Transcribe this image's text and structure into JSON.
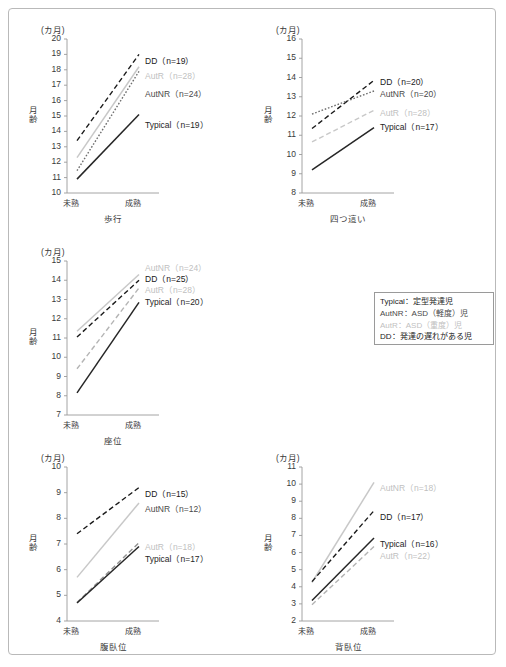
{
  "figure": {
    "unit_label": "(カ月)",
    "y_axis_title": "月齢",
    "x_ticks": [
      "未熟",
      "成熟"
    ],
    "caption": ""
  },
  "legend": {
    "items": [
      {
        "key": "Typical",
        "text": "Typical：定型発達児",
        "color": "#262626"
      },
      {
        "key": "AutNR",
        "text": "AutNR：ASD（軽度）児",
        "color": "#4a4a4a"
      },
      {
        "key": "AutR",
        "text": "AutR：ASD（重度）児",
        "color": "#bfbfbf"
      },
      {
        "key": "DD",
        "text": "DD：発達の遅れがある児",
        "color": "#1a1a1a"
      }
    ]
  },
  "colors": {
    "typical": "#262626",
    "autnr": "#6e6e6e",
    "autr": "#c8c8c8",
    "dd": "#1a1a1a",
    "axis": "#9a9a9a",
    "frame": "#b9b9b9"
  },
  "chart_data": [
    {
      "id": "walking",
      "type": "line",
      "title": "歩行",
      "xlabel": "歩行",
      "ylabel": "月齢",
      "unit": "(カ月)",
      "categories": [
        "未熟",
        "成熟"
      ],
      "x": [
        "未熟",
        "成熟"
      ],
      "ylim": [
        10,
        20
      ],
      "yticks": [
        10,
        11,
        12,
        13,
        14,
        15,
        16,
        17,
        18,
        19,
        20
      ],
      "grid": false,
      "series": [
        {
          "name": "DD",
          "n": 19,
          "label": "DD（n=19）",
          "values": [
            13.4,
            19.0
          ],
          "style": "dashed",
          "color": "#1a1a1a"
        },
        {
          "name": "AutR",
          "n": 28,
          "label": "AutR（n=28）",
          "values": [
            12.3,
            18.2
          ],
          "style": "solid",
          "color": "#c8c8c8"
        },
        {
          "name": "AutNR",
          "n": 24,
          "label": "AutNR（n=24）",
          "values": [
            11.45,
            17.9
          ],
          "style": "dotted",
          "color": "#6e6e6e"
        },
        {
          "name": "Typical",
          "n": 19,
          "label": "Typical（n=19）",
          "values": [
            10.9,
            15.1
          ],
          "style": "solid",
          "color": "#262626"
        }
      ]
    },
    {
      "id": "crawling",
      "type": "line",
      "title": "四つ這い",
      "xlabel": "四つ這い",
      "ylabel": "月齢",
      "unit": "(カ月)",
      "categories": [
        "未熟",
        "成熟"
      ],
      "x": [
        "未熟",
        "成熟"
      ],
      "ylim": [
        8,
        16
      ],
      "yticks": [
        8,
        9,
        10,
        11,
        12,
        13,
        14,
        15,
        16
      ],
      "grid": false,
      "series": [
        {
          "name": "DD",
          "n": 20,
          "label": "DD（n=20）",
          "values": [
            11.35,
            13.85
          ],
          "style": "dashed",
          "color": "#1a1a1a"
        },
        {
          "name": "AutNR",
          "n": 20,
          "label": "AutNR（n=20）",
          "values": [
            12.1,
            13.3
          ],
          "style": "dotted",
          "color": "#6e6e6e"
        },
        {
          "name": "AutR",
          "n": 28,
          "label": "AutR（n=28）",
          "values": [
            10.65,
            12.3
          ],
          "style": "dashed",
          "color": "#c8c8c8"
        },
        {
          "name": "Typical",
          "n": 17,
          "label": "Typical（n=17）",
          "values": [
            9.2,
            11.4
          ],
          "style": "solid",
          "color": "#262626"
        }
      ]
    },
    {
      "id": "sitting",
      "type": "line",
      "title": "座位",
      "xlabel": "座位",
      "ylabel": "月齢",
      "unit": "(カ月)",
      "categories": [
        "未熟",
        "成熟"
      ],
      "x": [
        "未熟",
        "成熟"
      ],
      "ylim": [
        7,
        15
      ],
      "yticks": [
        7,
        8,
        9,
        10,
        11,
        12,
        13,
        14,
        15
      ],
      "grid": false,
      "series": [
        {
          "name": "AutNR",
          "n": 24,
          "label": "AutNR（n=24）",
          "values": [
            11.35,
            14.3
          ],
          "style": "solid",
          "color": "#c8c8c8"
        },
        {
          "name": "DD",
          "n": 25,
          "label": "DD（n=25）",
          "values": [
            11.05,
            14.0
          ],
          "style": "dashed",
          "color": "#1a1a1a"
        },
        {
          "name": "AutR",
          "n": 28,
          "label": "AutR（n=28）",
          "values": [
            9.4,
            13.6
          ],
          "style": "dashed",
          "color": "#b4b4b4"
        },
        {
          "name": "Typical",
          "n": 20,
          "label": "Typical（n=20）",
          "values": [
            8.15,
            12.85
          ],
          "style": "solid",
          "color": "#262626"
        }
      ]
    },
    {
      "id": "prone",
      "type": "line",
      "title": "腹臥位",
      "xlabel": "腹臥位",
      "ylabel": "月齢",
      "unit": "(カ月)",
      "categories": [
        "未熟",
        "成熟"
      ],
      "x": [
        "未熟",
        "成熟"
      ],
      "ylim": [
        4,
        10
      ],
      "yticks": [
        4,
        5,
        6,
        7,
        8,
        9,
        10
      ],
      "grid": false,
      "series": [
        {
          "name": "DD",
          "n": 15,
          "label": "DD（n=15）",
          "values": [
            7.4,
            9.2
          ],
          "style": "dashed",
          "color": "#1a1a1a"
        },
        {
          "name": "AutNR",
          "n": 12,
          "label": "AutNR（n=12）",
          "values": [
            5.7,
            8.6
          ],
          "style": "solid",
          "color": "#c8c8c8"
        },
        {
          "name": "AutR",
          "n": 18,
          "label": "AutR（n=18）",
          "values": [
            4.72,
            7.05
          ],
          "style": "dashed",
          "color": "#909090"
        },
        {
          "name": "Typical",
          "n": 17,
          "label": "Typical（n=17）",
          "values": [
            4.7,
            6.9
          ],
          "style": "solid",
          "color": "#262626"
        }
      ]
    },
    {
      "id": "supine",
      "type": "line",
      "title": "背臥位",
      "xlabel": "背臥位",
      "ylabel": "月齢",
      "unit": "(カ月)",
      "categories": [
        "未熟",
        "成熟"
      ],
      "x": [
        "未熟",
        "成熟"
      ],
      "ylim": [
        2,
        11
      ],
      "yticks": [
        2,
        3,
        4,
        5,
        6,
        7,
        8,
        9,
        10,
        11
      ],
      "grid": false,
      "series": [
        {
          "name": "AutNR",
          "n": 18,
          "label": "AutNR（n=18）",
          "values": [
            4.25,
            10.1
          ],
          "style": "solid",
          "color": "#c8c8c8"
        },
        {
          "name": "DD",
          "n": 17,
          "label": "DD（n=17）",
          "values": [
            4.3,
            8.45
          ],
          "style": "dashed",
          "color": "#1a1a1a"
        },
        {
          "name": "Typical",
          "n": 16,
          "label": "Typical（n=16）",
          "values": [
            3.2,
            6.85
          ],
          "style": "solid",
          "color": "#262626"
        },
        {
          "name": "AutR",
          "n": 22,
          "label": "AutR（n=22）",
          "values": [
            2.95,
            6.35
          ],
          "style": "dashed",
          "color": "#b4b4b4"
        }
      ]
    }
  ],
  "panels": [
    {
      "id": "walking",
      "left": 18,
      "top": 16,
      "labels": [
        {
          "key": "DD",
          "text": "DD（n=19）",
          "x": 118,
          "y": 29,
          "cls": "c-dd"
        },
        {
          "key": "AutR",
          "text": "AutR（n=28）",
          "x": 118,
          "y": 44,
          "cls": "c-autr"
        },
        {
          "key": "AutNR",
          "text": "AutNR（n=24）",
          "x": 118,
          "y": 62,
          "cls": "c-autnr"
        },
        {
          "key": "Typical",
          "text": "Typical（n=19）",
          "x": 118,
          "y": 93,
          "cls": "c-typ"
        }
      ]
    },
    {
      "id": "crawling",
      "left": 253,
      "top": 16,
      "labels": [
        {
          "key": "DD",
          "text": "DD（n=20）",
          "x": 118,
          "y": 50,
          "cls": "c-dd"
        },
        {
          "key": "AutNR",
          "text": "AutNR（n=20）",
          "x": 118,
          "y": 62,
          "cls": "c-autnr"
        },
        {
          "key": "AutR",
          "text": "AutR（n=28）",
          "x": 118,
          "y": 81,
          "cls": "c-autr"
        },
        {
          "key": "Typical",
          "text": "Typical（n=17）",
          "x": 118,
          "y": 95,
          "cls": "c-typ"
        }
      ]
    },
    {
      "id": "sitting",
      "left": 18,
      "top": 238,
      "labels": [
        {
          "key": "AutNR",
          "text": "AutNR（n=24）",
          "x": 118,
          "y": 14,
          "cls": "c-autr"
        },
        {
          "key": "DD",
          "text": "DD（n=25）",
          "x": 118,
          "y": 25,
          "cls": "c-dd"
        },
        {
          "key": "AutR",
          "text": "AutR（n=28）",
          "x": 118,
          "y": 36,
          "cls": "c-autr"
        },
        {
          "key": "Typical",
          "text": "Typical（n=20）",
          "x": 118,
          "y": 48,
          "cls": "c-typ"
        }
      ]
    },
    {
      "id": "prone",
      "left": 18,
      "top": 444,
      "labels": [
        {
          "key": "DD",
          "text": "DD（n=15）",
          "x": 118,
          "y": 34,
          "cls": "c-dd"
        },
        {
          "key": "AutNR",
          "text": "AutNR（n=12）",
          "x": 118,
          "y": 49,
          "cls": "c-autnr"
        },
        {
          "key": "AutR",
          "text": "AutR（n=18）",
          "x": 118,
          "y": 87,
          "cls": "c-autr"
        },
        {
          "key": "Typical",
          "text": "Typical（n=17）",
          "x": 118,
          "y": 99,
          "cls": "c-typ"
        }
      ]
    },
    {
      "id": "supine",
      "left": 253,
      "top": 444,
      "labels": [
        {
          "key": "AutNR",
          "text": "AutNR（n=18）",
          "x": 118,
          "y": 28,
          "cls": "c-autr"
        },
        {
          "key": "DD",
          "text": "DD（n=17）",
          "x": 118,
          "y": 57,
          "cls": "c-dd"
        },
        {
          "key": "Typical",
          "text": "Typical（n=16）",
          "x": 118,
          "y": 84,
          "cls": "c-typ"
        },
        {
          "key": "AutR",
          "text": "AutR（n=22）",
          "x": 118,
          "y": 96,
          "cls": "c-autr"
        }
      ]
    }
  ]
}
